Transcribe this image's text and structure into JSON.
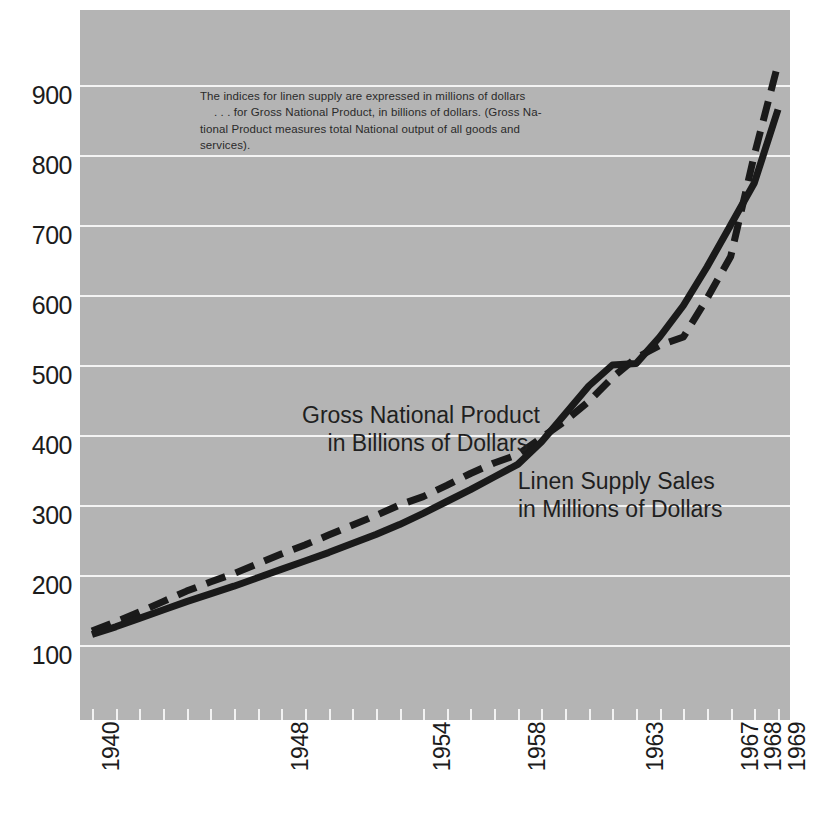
{
  "figure": {
    "background_color": "#ffffff",
    "panel_color": "#b4b4b4",
    "gridline_color": "#f4f4f4",
    "line_color": "#1a1a1a"
  },
  "note": {
    "line1": "The indices for linen supply are expressed in millions of dollars",
    "line2": ". . . for Gross National Product, in billions of dollars. (Gross Na-",
    "line3": "tional Product measures total National output of all goods and",
    "line4": "services)."
  },
  "labels": {
    "gnp_line1": "Gross National Product",
    "gnp_line2": "in Billions of Dollars",
    "lss_line1": "Linen Supply Sales",
    "lss_line2": "in Millions of Dollars"
  },
  "chart_data": {
    "type": "line",
    "title": "",
    "xlabel": "",
    "ylabel": "",
    "xlim": [
      1940,
      1969
    ],
    "ylim": [
      100,
      1000
    ],
    "grid": true,
    "legend": "inline-annotations",
    "yticks": [
      100,
      200,
      300,
      400,
      500,
      600,
      700,
      800,
      900
    ],
    "ytick_labels": [
      "100",
      "200",
      "300",
      "400",
      "500",
      "600",
      "700",
      "800",
      "900"
    ],
    "xticks_labeled": [
      1940,
      1948,
      1954,
      1958,
      1963,
      1967,
      1968,
      1969
    ],
    "xtick_labels": [
      "1940",
      "1948",
      "1954",
      "1958",
      "1963",
      "1967",
      "1968",
      "1969"
    ],
    "x": [
      1940,
      1941,
      1942,
      1943,
      1944,
      1945,
      1946,
      1947,
      1948,
      1949,
      1950,
      1951,
      1952,
      1953,
      1954,
      1955,
      1956,
      1957,
      1958,
      1959,
      1960,
      1961,
      1962,
      1963,
      1964,
      1965,
      1966,
      1967,
      1968,
      1969
    ],
    "series": [
      {
        "name": "Gross National Product in Billions of Dollars",
        "style": "dashed",
        "color": "#1a1a1a",
        "unit": "billions of dollars",
        "values": [
          120,
          133,
          147,
          162,
          177,
          190,
          202,
          216,
          230,
          243,
          257,
          271,
          285,
          300,
          312,
          328,
          345,
          360,
          372,
          396,
          420,
          448,
          482,
          510,
          528,
          540,
          595,
          655,
          800,
          930
        ]
      },
      {
        "name": "Linen Supply Sales in Millions of Dollars",
        "style": "solid",
        "color": "#1a1a1a",
        "unit": "millions of dollars",
        "values": [
          115,
          126,
          138,
          150,
          162,
          173,
          184,
          196,
          208,
          220,
          232,
          245,
          258,
          272,
          288,
          305,
          322,
          340,
          358,
          390,
          430,
          470,
          500,
          502,
          540,
          585,
          640,
          700,
          760,
          865
        ]
      }
    ]
  }
}
